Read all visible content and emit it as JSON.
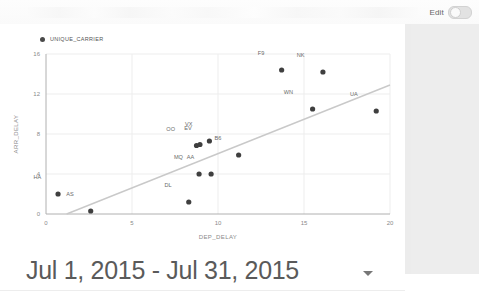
{
  "toolbar": {
    "edit_label": "Edit",
    "edit_toggle_state": "off"
  },
  "date_range": {
    "label": "Jul 1, 2015 - Jul 31, 2015",
    "caret": "chevron-down-icon"
  },
  "legend": {
    "series_label": "UNIQUE_CARRIER"
  },
  "colors": {
    "point": "#3f3f3f",
    "trendline": "#c9c9c9",
    "grid": "#ededed",
    "axis": "#b0b0b0",
    "axis_text": "#8a8a8a",
    "panel": "#ececec"
  },
  "chart_data": {
    "type": "scatter",
    "title": "",
    "xlabel": "DEP_DELAY",
    "ylabel": "ARR_DELAY",
    "xlim": [
      0,
      20
    ],
    "ylim": [
      0,
      16
    ],
    "xticks": [
      "0",
      "5",
      "10",
      "15",
      "20"
    ],
    "yticks": [
      "0",
      "4",
      "8",
      "12",
      "16"
    ],
    "grid": true,
    "legend_position": "top-left",
    "legend_entries": [
      "UNIQUE_CARRIER"
    ],
    "point_label_field": "UNIQUE_CARRIER",
    "points": [
      {
        "label": "HA",
        "x": 0.7,
        "y": 2.0,
        "label_dx": -1.2,
        "label_dy": 1.5
      },
      {
        "label": "AS",
        "x": 2.6,
        "y": 0.3,
        "label_dx": -1.2,
        "label_dy": 1.5
      },
      {
        "label": "DL",
        "x": 8.3,
        "y": 1.2,
        "label_dx": -1.2,
        "label_dy": 1.5
      },
      {
        "label": "MQ",
        "x": 8.9,
        "y": 4.0,
        "label_dx": -1.2,
        "label_dy": 1.5
      },
      {
        "label": "AA",
        "x": 9.6,
        "y": 4.0,
        "label_dx": -1.2,
        "label_dy": 1.5
      },
      {
        "label": "OO",
        "x": 8.75,
        "y": 6.85,
        "label_dx": -1.5,
        "label_dy": 1.5
      },
      {
        "label": "EV",
        "x": 8.95,
        "y": 6.95,
        "label_dx": -0.7,
        "label_dy": 1.5
      },
      {
        "label": "VX",
        "x": 9.5,
        "y": 7.3,
        "label_dx": -1.2,
        "label_dy": 1.5
      },
      {
        "label": "B6",
        "x": 11.2,
        "y": 5.9,
        "label_dx": -1.2,
        "label_dy": 1.5
      },
      {
        "label": "F9",
        "x": 13.7,
        "y": 14.4,
        "label_dx": -1.2,
        "label_dy": 1.5
      },
      {
        "label": "WN",
        "x": 15.5,
        "y": 10.5,
        "label_dx": -1.4,
        "label_dy": 1.5
      },
      {
        "label": "NK",
        "x": 16.1,
        "y": 14.2,
        "label_dx": -1.3,
        "label_dy": 1.5
      },
      {
        "label": "UA",
        "x": 19.2,
        "y": 10.3,
        "label_dx": -1.3,
        "label_dy": 1.5
      }
    ],
    "trendline": {
      "x0": 1.2,
      "y0": 0.0,
      "x1": 20.0,
      "y1": 12.9
    }
  }
}
